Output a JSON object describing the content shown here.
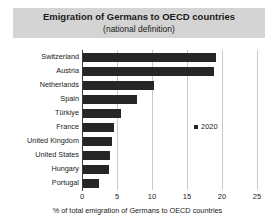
{
  "chart_data": {
    "type": "bar",
    "orientation": "horizontal",
    "title": "Emigration of Germans to OECD countries",
    "subtitle": "(national definition)",
    "xlabel": "% of total emigration of Germans to OECD countries",
    "ylabel": "",
    "xlim": [
      0,
      25
    ],
    "xticks": [
      0,
      5,
      10,
      15,
      20,
      25
    ],
    "grid": true,
    "legend_position": "center-right",
    "legend": [
      "2020"
    ],
    "categories": [
      "Switzerland",
      "Austria",
      "Netherlands",
      "Spain",
      "Türkiye",
      "France",
      "United Kingdom",
      "United States",
      "Hungary",
      "Portugal"
    ],
    "series": [
      {
        "name": "2020",
        "color": "#262626",
        "values": [
          19.1,
          18.9,
          10.3,
          7.8,
          5.6,
          4.5,
          4.3,
          4.0,
          3.8,
          2.4
        ]
      }
    ]
  },
  "legend": {
    "marker_name": "legend-square-marker",
    "label": "2020"
  },
  "colors": {
    "bar": "#262626",
    "title_band": "#d4d4d4",
    "gridline": "#c9c9c9",
    "axis": "#3a3a3a"
  }
}
